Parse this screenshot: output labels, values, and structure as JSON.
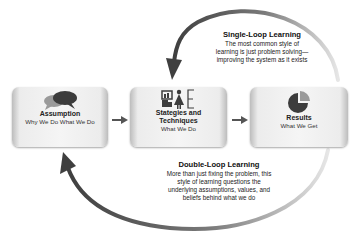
{
  "diagram": {
    "boxes": [
      {
        "title": "Assumption",
        "subtitle": "Why We Do What We Do",
        "icon": "speech-bubbles-icon"
      },
      {
        "title": "Stategies and Techniques",
        "title_line1": "Stategies and",
        "title_line2": "Techniques",
        "subtitle": "What We Do",
        "icon": "presentation-person-icon"
      },
      {
        "title": "Results",
        "subtitle": "What We Get",
        "icon": "pie-chart-icon"
      }
    ],
    "single_loop": {
      "title": "Single-Loop Learning",
      "lines": [
        "The most common style of",
        "learning is just problem solving—",
        "improving the system as it exists"
      ]
    },
    "double_loop": {
      "title": "Double-Loop Learning",
      "lines": [
        "More than just fixing the problem, this",
        "style of learning questions the",
        "underlying assumptions, values, and",
        "beliefs behind what we do"
      ]
    },
    "colors": {
      "arrow": "#4a4a4a",
      "box_fill": "#f2f2f2",
      "icon_dark": "#3c3c3c",
      "icon_light": "#9a9a9a"
    }
  }
}
